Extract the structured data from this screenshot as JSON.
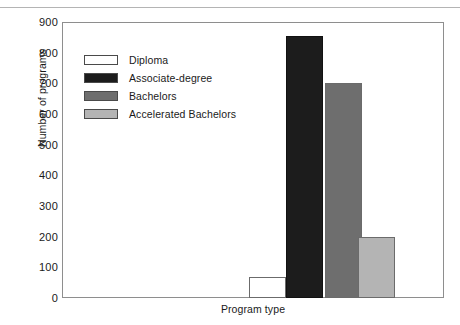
{
  "top_strip": {
    "clipped_text": ""
  },
  "chart_data": {
    "type": "bar",
    "title": "",
    "xlabel": "Program type",
    "ylabel": "Number of programs",
    "categories": [
      "Diploma",
      "Associate-degree",
      "Bachelors",
      "Accelerated Bachelors"
    ],
    "values": [
      70,
      855,
      700,
      200
    ],
    "colors": [
      "#ffffff",
      "#1c1c1c",
      "#6e6e6e",
      "#b4b4b4"
    ],
    "ylim": [
      0,
      900
    ],
    "yticks": [
      0,
      100,
      200,
      300,
      400,
      500,
      600,
      700,
      800,
      900
    ],
    "ytick_labels": [
      "0",
      "100",
      "200",
      "300",
      "400",
      "500",
      "600",
      "700",
      "800",
      "900"
    ],
    "xticks": [],
    "xtick_labels": [],
    "grid": false,
    "legend_position": "upper-left",
    "legend_entries": [
      {
        "label": "Diploma",
        "color": "#ffffff"
      },
      {
        "label": "Associate-degree",
        "color": "#1c1c1c"
      },
      {
        "label": "Bachelors",
        "color": "#6e6e6e"
      },
      {
        "label": "Accelerated Bachelors",
        "color": "#b4b4b4"
      }
    ]
  },
  "frame": {
    "border_color": "#8e8e8e"
  }
}
